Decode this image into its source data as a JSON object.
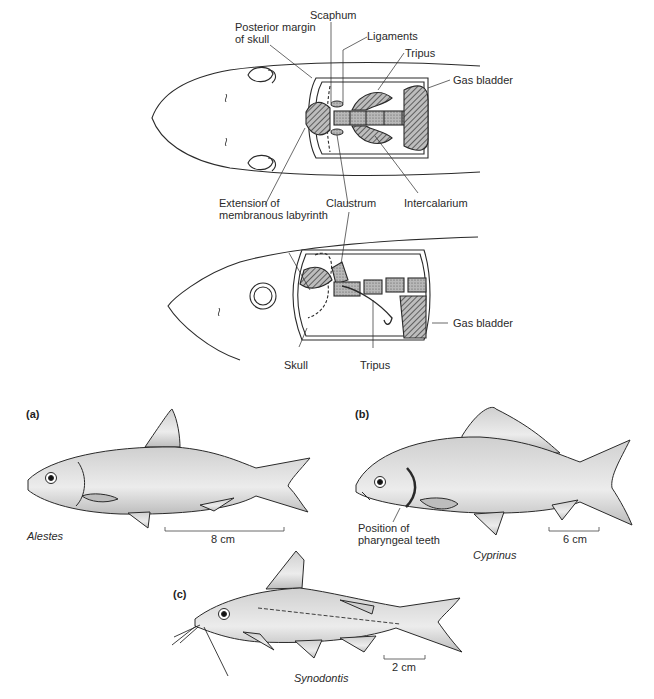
{
  "figure": {
    "weberian_dorsal": {
      "labels": {
        "scaphum": "Scaphum",
        "posterior_margin": "Posterior margin\nof skull",
        "posterior_margin_l1": "Posterior margin",
        "posterior_margin_l2": "of skull",
        "ligaments": "Ligaments",
        "tripus": "Tripus",
        "gas_bladder": "Gas bladder",
        "extension_l1": "Extension of",
        "extension_l2": "membranous labyrinth",
        "claustrum": "Claustrum",
        "intercalarium": "Intercalarium"
      }
    },
    "weberian_lateral": {
      "labels": {
        "gas_bladder": "Gas bladder",
        "skull": "Skull",
        "tripus": "Tripus"
      }
    },
    "panels": [
      {
        "id": "a",
        "tag": "(a)",
        "species": "Alestes",
        "scale": "8 cm"
      },
      {
        "id": "b",
        "tag": "(b)",
        "species": "Cyprinus",
        "scale": "6 cm",
        "annotation_l1": "Position of",
        "annotation_l2": "pharyngeal teeth"
      },
      {
        "id": "c",
        "tag": "(c)",
        "species": "Synodontis",
        "scale": "2 cm"
      }
    ],
    "colors": {
      "line": "#2a2a2a",
      "fish_fill": "#d9d9d9",
      "hatch": "#6a6a6a",
      "bone": "#9a9a9a"
    }
  }
}
